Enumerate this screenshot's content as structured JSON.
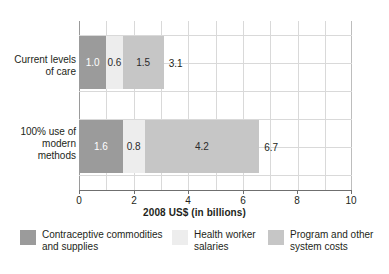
{
  "chart_data": {
    "type": "bar",
    "orientation": "horizontal",
    "stacked": true,
    "title": "",
    "xlabel": "2008 US$ (in billions)",
    "ylabel": "",
    "xlim": [
      0,
      10
    ],
    "xticks": [
      "0",
      "2",
      "4",
      "6",
      "8",
      "10"
    ],
    "grid": true,
    "legend_position": "bottom",
    "categories": [
      "Current levels of care",
      "100% use of modern methods"
    ],
    "category_label_lines": [
      [
        "Current levels",
        "of care"
      ],
      [
        "100% use of",
        "modern",
        "methods"
      ]
    ],
    "series": [
      {
        "name": "Contraceptive commodities and supplies",
        "values": [
          1.0,
          1.6
        ],
        "color": "#9b9b9b"
      },
      {
        "name": "Health worker salaries",
        "values": [
          0.6,
          0.8
        ],
        "color": "#ededed"
      },
      {
        "name": "Program and other system costs",
        "values": [
          1.5,
          4.2
        ],
        "color": "#c6c6c6"
      }
    ],
    "segment_labels": [
      [
        "1.0",
        "0.6",
        "1.5"
      ],
      [
        "1.6",
        "0.8",
        "4.2"
      ]
    ],
    "totals": [
      "3.1",
      "6.7"
    ],
    "total_values": [
      3.1,
      6.7
    ]
  },
  "legend": {
    "items": [
      {
        "label": "Contraceptive commodities\nand supplies",
        "color": "#9b9b9b"
      },
      {
        "label": "Health worker\nsalaries",
        "color": "#ededed"
      },
      {
        "label": "Program and other\nsystem costs",
        "color": "#c6c6c6"
      }
    ]
  },
  "axis": {
    "title": "2008 US$ (in billions)",
    "ticks": [
      "0",
      "2",
      "4",
      "6",
      "8",
      "10"
    ]
  }
}
